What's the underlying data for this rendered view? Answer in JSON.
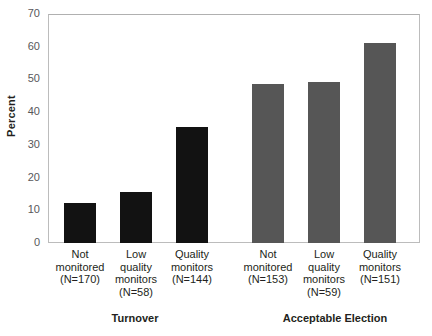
{
  "chart_data": {
    "type": "bar",
    "title": "",
    "xlabel": "",
    "ylabel": "Percent",
    "ylim": [
      0,
      70
    ],
    "yticks": [
      "0",
      "10",
      "20",
      "30",
      "40",
      "50",
      "60",
      "70"
    ],
    "grid": false,
    "legend": "none",
    "groups": [
      {
        "name": "Turnover",
        "color": "#121212",
        "categories": [
          "Not monitored (N=170)",
          "Low quality monitors (N=58)",
          "Quality monitors (N=144)"
        ],
        "values": [
          12.1,
          15.5,
          35.5
        ]
      },
      {
        "name": "Acceptable Election",
        "color": "#565656",
        "categories": [
          "Not monitored (N=153)",
          "Low quality monitors (N=59)",
          "Quality monitors (N=151)"
        ],
        "values": [
          48.5,
          49.2,
          61.2
        ]
      }
    ],
    "bars": [
      {
        "group": "Turnover",
        "label_lines": [
          "Not",
          "monitored",
          "(N=170)"
        ],
        "value": 12.1,
        "color": "#121212"
      },
      {
        "group": "Turnover",
        "label_lines": [
          "Low",
          "quality",
          "monitors",
          "(N=58)"
        ],
        "value": 15.5,
        "color": "#121212"
      },
      {
        "group": "Turnover",
        "label_lines": [
          "Quality",
          "monitors",
          "(N=144)"
        ],
        "value": 35.5,
        "color": "#121212"
      },
      {
        "group": "Acceptable Election",
        "label_lines": [
          "Not",
          "monitored",
          "(N=153)"
        ],
        "value": 48.5,
        "color": "#565656"
      },
      {
        "group": "Acceptable Election",
        "label_lines": [
          "Low",
          "quality",
          "monitors",
          "(N=59)"
        ],
        "value": 49.2,
        "color": "#565656"
      },
      {
        "group": "Acceptable Election",
        "label_lines": [
          "Quality",
          "monitors",
          "(N=151)"
        ],
        "value": 61.2,
        "color": "#565656"
      }
    ]
  },
  "axis": {
    "y_title": "Percent",
    "y_ticks": [
      "70",
      "60",
      "50",
      "40",
      "30",
      "20",
      "10",
      "0"
    ]
  },
  "bar_labels": [
    {
      "l1": "Not",
      "l2": "monitored",
      "l3": "(N=170)",
      "l4": ""
    },
    {
      "l1": "Low",
      "l2": "quality",
      "l3": "monitors",
      "l4": "(N=58)"
    },
    {
      "l1": "Quality",
      "l2": "monitors",
      "l3": "(N=144)",
      "l4": ""
    },
    {
      "l1": "Not",
      "l2": "monitored",
      "l3": "(N=153)",
      "l4": ""
    },
    {
      "l1": "Low",
      "l2": "quality",
      "l3": "monitors",
      "l4": "(N=59)"
    },
    {
      "l1": "Quality",
      "l2": "monitors",
      "l3": "(N=151)",
      "l4": ""
    }
  ],
  "group_titles": {
    "left": "Turnover",
    "right": "Acceptable Election"
  },
  "colors": {
    "bar_dark": "#121212",
    "bar_gray": "#565656",
    "frame": "#bcbcbc",
    "tick_text": "#58585b",
    "text": "#231f20",
    "background": "#ffffff"
  }
}
